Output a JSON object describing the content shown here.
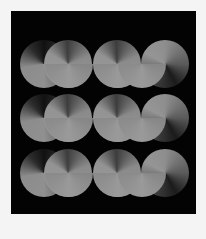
{
  "artwork": {
    "description": "Abstract pattern of gray gradient circles arranged in three wave rows on black",
    "colors": {
      "background": "#030303",
      "frame": "#f4f4f4",
      "shape_light": "#9a9a9a",
      "shape_dark": "#1b1b1b"
    },
    "rows": [
      {
        "top": 29
      },
      {
        "top": 83
      },
      {
        "top": 138
      }
    ]
  }
}
